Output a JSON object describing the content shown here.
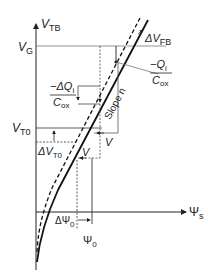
{
  "diagram": {
    "type": "mosfet-threshold-voltage-vs-surface-potential",
    "colors": {
      "ink": "#222222",
      "grid": "#555555",
      "background": "#ffffff"
    },
    "axes": {
      "y_label_main": "V",
      "y_label_sub": "TB",
      "x_label_main": "Ψ",
      "x_label_sub": "s"
    },
    "labels": {
      "vg_main": "V",
      "vg_sub": "G",
      "vt0_main": "V",
      "vt0_sub": "T0",
      "delta_vfb_main": "ΔV",
      "delta_vfb_sub": "FB",
      "qi_num_main": "−Q",
      "qi_num_sub": "i",
      "qi_den_main": "C",
      "qi_den_sub": "ox",
      "dq_num_main": "−ΔQ",
      "dq_num_sub": "i",
      "dq_den_main": "C",
      "dq_den_sub": "ox",
      "slope": "Slope n",
      "v_upper": "V",
      "v_lower": "V",
      "delta_vt0_main": "ΔV",
      "delta_vt0_sub": "T0",
      "delta_psi0_main": "ΔΨ",
      "delta_psi0_sub": "0",
      "psi0_main": "Ψ",
      "psi0_sub": "0"
    },
    "curves": [
      {
        "name": "solid-curve",
        "style": "solid"
      },
      {
        "name": "dashed-curve",
        "style": "dashed"
      }
    ]
  }
}
